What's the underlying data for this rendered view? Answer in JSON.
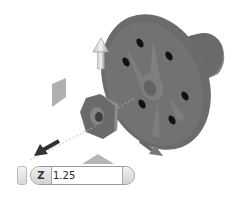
{
  "viewport": {
    "title": "3D model viewport",
    "part": "flange",
    "background": "#ffffff",
    "part_color": "#6e6e6e"
  },
  "manipulator": {
    "icons": [
      "arrow-up-icon",
      "arrow-down-left-icon",
      "arrow-down-right-icon",
      "plane-handle-icon",
      "triangle-handle-icon"
    ]
  },
  "coordinate_input": {
    "axis": "Z",
    "value": "1.25"
  }
}
